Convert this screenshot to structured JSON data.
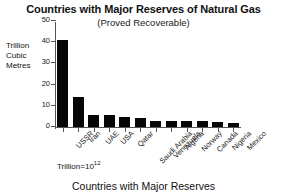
{
  "chart_data": {
    "type": "bar",
    "title": "Countries with Major Reserves of Natural Gas",
    "subtitle": "(Proved Recoverable)",
    "xlabel": "Countries with Major Reserves",
    "ylabel": "Trillion Cubic Metres",
    "ylabel_lines": [
      "Trillion",
      "Cubic",
      "Metres"
    ],
    "footnote": "Trillion=10",
    "footnote_exponent": "12",
    "categories": [
      "USSR",
      "Iran",
      "UAE",
      "USA",
      "Qatar",
      "Saudi Arabia",
      "Venezuela",
      "Algeria",
      "Norway",
      "Canada",
      "Nigeria",
      "Mexico"
    ],
    "values": [
      41,
      14,
      5.8,
      5.6,
      4.6,
      4.2,
      3.0,
      3.0,
      2.9,
      2.7,
      2.5,
      2.0
    ],
    "ylim": [
      0,
      50
    ],
    "yticks": [
      0,
      10,
      20,
      30,
      40,
      50
    ],
    "ytick_labels": [
      "0",
      "10",
      "20",
      "30",
      "40",
      "50"
    ],
    "grid": false,
    "legend": "none",
    "bar_color": "#060606"
  }
}
